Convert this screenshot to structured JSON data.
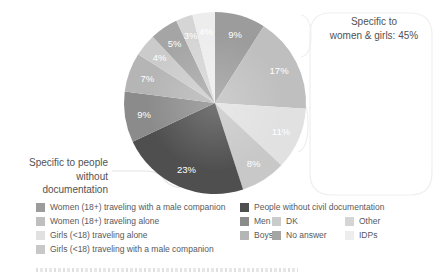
{
  "chart_data": {
    "type": "pie",
    "unit": "%",
    "total_label": null,
    "label_color": "#ffffff",
    "start_angle_deg": 0,
    "slices": [
      {
        "label": "Women (18+) traveling with a male companion",
        "value": 9,
        "color": "#9c9c9c"
      },
      {
        "label": "Women (18+) traveling alone",
        "value": 17,
        "color": "#bfbfbf"
      },
      {
        "label": "Girls (<18) traveling alone",
        "value": 11,
        "color": "#e1e1e1"
      },
      {
        "label": "Girls (<18) traveling with a male companion",
        "value": 8,
        "color": "#c8c8c8"
      },
      {
        "label": "People without civil documentation",
        "value": 23,
        "color": "#4f4f4f"
      },
      {
        "label": "Men",
        "value": 9,
        "color": "#8b8b8b"
      },
      {
        "label": "Boys",
        "value": 7,
        "color": "#b5b5b5"
      },
      {
        "label": "DK",
        "value": 4,
        "color": "#cbcbcb"
      },
      {
        "label": "No answer",
        "value": 5,
        "color": "#a5a5a5"
      },
      {
        "label": "Other",
        "value": 3,
        "color": "#d5d5d5"
      },
      {
        "label": "IDPs",
        "value": 4,
        "color": "#ededed"
      }
    ],
    "legend_position": "bottom"
  },
  "annotations": {
    "women_girls": {
      "line1": "Specific to",
      "line2": "women & girls: 45%"
    },
    "documentation": {
      "line1": "Specific to people",
      "line2": "without documentation"
    }
  },
  "legend": {
    "left_item_indices": [
      0,
      1,
      2,
      3
    ],
    "right_rows_indices": [
      [
        4
      ],
      [
        5,
        7,
        9
      ],
      [
        6,
        8,
        10
      ]
    ]
  },
  "callout_color": "#ededed"
}
